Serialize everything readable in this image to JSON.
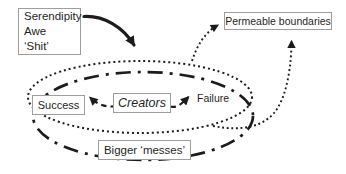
{
  "figure": {
    "background_color": "#ffffff",
    "ink_color": "#1c1c1c",
    "box_border_color": "#9e9e9e",
    "serendipity_box": {
      "line1": "Serendipity",
      "line2": "Awe",
      "line3": "‘Shit’"
    },
    "permeable_box": {
      "label": "Permeable boundaries"
    },
    "success_box": {
      "label": "Success"
    },
    "creators_box": {
      "label": "Creators"
    },
    "failure_label": {
      "label": "Failure"
    },
    "messes_box": {
      "label": "Bigger ‘messes’"
    }
  }
}
